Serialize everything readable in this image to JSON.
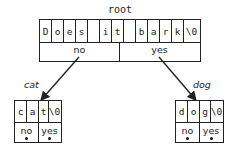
{
  "root": {
    "title": "root",
    "chars": [
      "D",
      "o",
      "e",
      "s",
      " ",
      "i",
      "t",
      " ",
      "b",
      "a",
      "r",
      "k",
      "\\0"
    ],
    "pointers": [
      "no",
      "yes"
    ]
  },
  "left": {
    "edge_label": "cat",
    "chars": [
      "c",
      "a",
      "t",
      "\\0"
    ],
    "pointers": [
      "no",
      "yes"
    ]
  },
  "right": {
    "edge_label": "dog",
    "chars": [
      "d",
      "o",
      "g",
      "\\0"
    ],
    "pointers": [
      "no",
      "yes"
    ]
  }
}
